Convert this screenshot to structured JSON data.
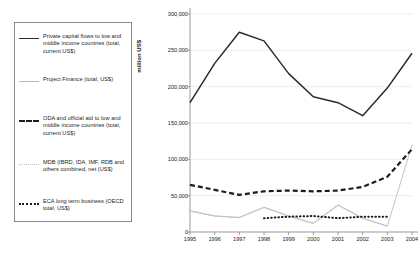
{
  "legend": {
    "items": [
      {
        "style": "solid",
        "label": "Private capital flows to low and middle income countries (total, current US$)"
      },
      {
        "style": "thin",
        "label": "Project Finance (total, US$)"
      },
      {
        "style": "dash",
        "label": "ODA and official aid to low and middle income countries (total, current US$)"
      },
      {
        "style": "dot-light",
        "label": "MDB (IBRD, IDA, IMF, RDB and others combined, net (US$)"
      },
      {
        "style": "dot-dark",
        "label": "ECA long term business (OECD total, US$)"
      }
    ]
  },
  "chart_data": {
    "type": "line",
    "title": "",
    "xlabel": "",
    "ylabel": "million US$",
    "x": [
      1995,
      1996,
      1997,
      1998,
      1999,
      2000,
      2001,
      2002,
      2003,
      2004
    ],
    "xtick_labels": [
      "1995",
      "1996",
      "1997",
      "1998",
      "1999",
      "2000",
      "2001",
      "2002",
      "2003",
      "2004"
    ],
    "ytick_labels": [
      "0",
      "50,000",
      "100,000",
      "150,000",
      "200,000",
      "250,000",
      "300,000"
    ],
    "ytick_values": [
      0,
      50000,
      100000,
      150000,
      200000,
      250000,
      300000
    ],
    "ylim": [
      0,
      300000
    ],
    "xlim": [
      1995,
      2004
    ],
    "grid": true,
    "legend_position": "left-outside",
    "series": [
      {
        "name": "Private capital flows to low and middle income countries (total, current US$)",
        "style": "solid",
        "color": "#2b2b2b",
        "values": [
          178000,
          232000,
          275000,
          263000,
          218000,
          186000,
          178000,
          160000,
          198000,
          246000
        ]
      },
      {
        "name": "Project Finance (total, US$)",
        "style": "thin",
        "color": "#bdbdbd",
        "values": [
          29000,
          22000,
          20000,
          34000,
          22000,
          12000,
          37000,
          19000,
          8000,
          120000
        ]
      },
      {
        "name": "ODA and official aid to low and middle income countries (total, current US$)",
        "style": "dash",
        "color": "#1d1d1d",
        "values": [
          65000,
          58000,
          51000,
          56000,
          57000,
          56000,
          57000,
          62000,
          76000,
          114000
        ]
      },
      {
        "name": "MDB (IBRD, IDA, IMF, RDB and others combined, net (US$)",
        "style": "dot-light",
        "color": "#c2c2c2",
        "values": [
          29000,
          22000,
          20000,
          34000,
          22000,
          12000,
          37000,
          19000,
          8000,
          null
        ]
      },
      {
        "name": "ECA long term business (OECD total, US$)",
        "style": "dot-dark",
        "color": "#1d1d1d",
        "values": [
          null,
          null,
          null,
          19000,
          21000,
          22000,
          19000,
          21000,
          21000,
          null
        ]
      }
    ]
  }
}
